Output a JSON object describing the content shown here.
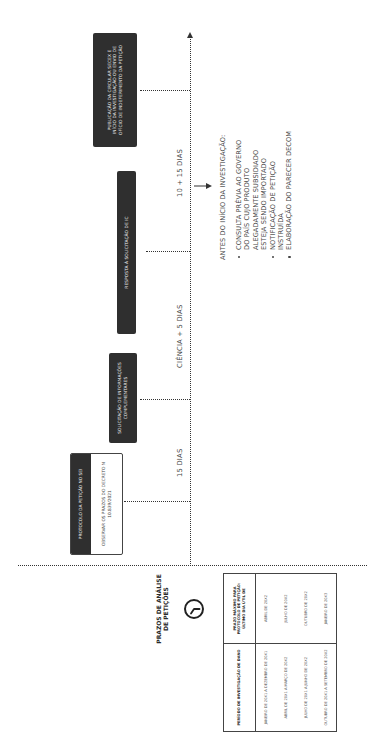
{
  "header": {
    "title_line1": "PRAZOS DE ANÁLISE",
    "title_line2": "DE PETIÇÕES",
    "icon": "clock-icon"
  },
  "table": {
    "columns": [
      "PERÍODO DE INVESTIGAÇÃO DE DANO",
      "PRAZO MÁXIMO PARA PROTOCOLO DE PETIÇÃO: ÚLTIMO DIA ÚTIL DE"
    ],
    "rows": [
      {
        "period": "JANEIRO DE 20X1 A DEZEMBRO DE 20X1",
        "deadline": "ABRIL DE 20X2"
      },
      {
        "period": "ABRIL DE 20X1 A MARÇO DE 20X2",
        "deadline": "JULHO DE 20X2"
      },
      {
        "period": "JULHO DE 20X1 A JUNHO DE 20X2",
        "deadline": "OUTUBRO DE 20X2"
      },
      {
        "period": "OUTUBRO DE 20X1 A SETEMBRO DE 20X2",
        "deadline": "JANEIRO DE 20X3"
      }
    ]
  },
  "timeline": {
    "events": [
      {
        "id": "protocolo",
        "title": "PROTOCOLO DA PETIÇÃO NO SEI",
        "note": "OBSERVAR OS PRAZOS DO DECRETO N 10.839/2021"
      },
      {
        "id": "solicitacao",
        "title": "SOLICITAÇÃO DE INFORMAÇÕES COMPLEMENTARES"
      },
      {
        "id": "resposta",
        "title": "RESPOSTA À SOLICITAÇÃO DE IC"
      },
      {
        "id": "publicacao",
        "title": "PUBLICAÇÃO DA CIRCULAR SECEX E INÍCIO DA INVESTIGAÇÃO OU ENVIO DE OFÍCIO DE INDEFERIMENTO DA PETIÇÃO"
      }
    ],
    "intervals": [
      {
        "label": "15 DIAS"
      },
      {
        "label": "CIÊNCIA + 5 DIAS"
      },
      {
        "label": "10 + 15 DIAS"
      }
    ]
  },
  "notes": {
    "title": "ANTES DO INÍCIO DA INVESTIGAÇÃO:",
    "items": [
      "CONSULTA PRÉVIA AO GOVERNO\nDO PAÍS CUJO PRODUTO\nALEGADAMENTE SUBSIDIADO\nESTEJA SENDO IMPORTADO",
      "NOTIFICAÇÃO DE PETIÇÃO\nINSTRUÍDA",
      "ELABORAÇÃO DO PARECER DECOM"
    ]
  },
  "colors": {
    "box_fill": "#2f2f2f",
    "box_text": "#f2f2f2",
    "line": "#333333",
    "text": "#444444",
    "background": "#ffffff"
  }
}
